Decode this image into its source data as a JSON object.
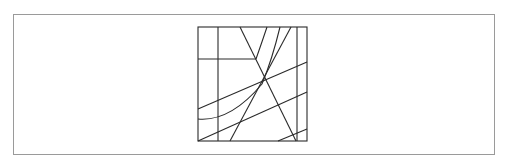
{
  "canvas": {
    "width": 506,
    "height": 166,
    "background": "#ffffff"
  },
  "frame": {
    "x": 13,
    "y": 14,
    "width": 482,
    "height": 141,
    "border_color": "#9a9a9a"
  },
  "diagram": {
    "type": "line-arrangement",
    "square": {
      "x": 198,
      "y": 27,
      "width": 109,
      "height": 114
    },
    "stroke_color": "#2a2a2a",
    "lines": [
      {
        "id": "v-left",
        "d": "M218 27 L218 141"
      },
      {
        "id": "v-right",
        "d": "M297 27 L297 141"
      },
      {
        "id": "h-top",
        "d": "M198 59 L256 59"
      },
      {
        "id": "diag-main",
        "d": "M240 27 L296 141"
      },
      {
        "id": "diag-steep",
        "d": "M230 141 L291 27"
      },
      {
        "id": "slope-1",
        "d": "M198 109 L307 62"
      },
      {
        "id": "slope-2",
        "d": "M198 141 L307 92"
      },
      {
        "id": "slope-3",
        "d": "M278 141 L307 129"
      }
    ],
    "curves": [
      {
        "id": "curve-a",
        "d": "M256 59 Q262 42 267 27"
      },
      {
        "id": "curve-b",
        "d": "M198 119 Q230 122 262 84 Q272 60 280 27"
      }
    ]
  }
}
